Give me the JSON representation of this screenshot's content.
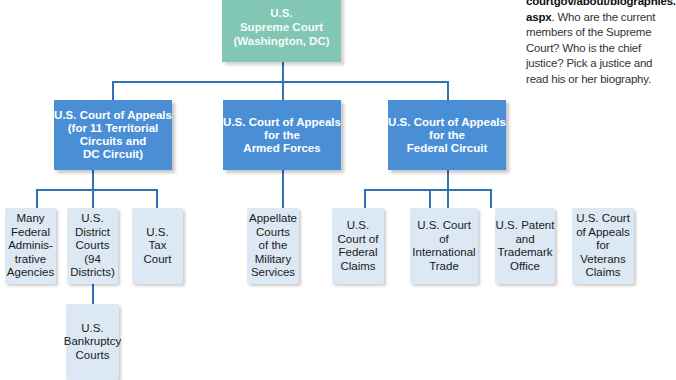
{
  "sidebar_note": {
    "link_line1": "courtgov/about/biographies.",
    "link_line2": "aspx",
    "text": ". Who are the current members of the Supreme Court? Who is the chief justice? Pick a justice and read his or her biography."
  },
  "root": {
    "label": "U.S.\nSupreme Court\n(Washington, DC)"
  },
  "appeals": [
    {
      "label": "U.S. Court of Appeals\n(for 11 Territorial\nCircuits and\nDC Circuit)"
    },
    {
      "label": "U.S. Court of Appeals\nfor the\nArmed Forces"
    },
    {
      "label": "U.S. Court of Appeals\nfor the\nFederal Circuit"
    }
  ],
  "lower": [
    {
      "label": "Many\nFederal\nAdminis-\ntrative\nAgencies"
    },
    {
      "label": "U.S.\nDistrict\nCourts\n(94\nDistricts)"
    },
    {
      "label": "U.S.\nTax\nCourt"
    },
    {
      "label": "Appellate\nCourts\nof the\nMilitary\nServices"
    },
    {
      "label": "U.S.\nCourt of\nFederal\nClaims"
    },
    {
      "label": "U.S. Court\nof\nInternational\nTrade"
    },
    {
      "label": "U.S. Patent\nand\nTrademark\nOffice"
    },
    {
      "label": "U.S. Court\nof Appeals\nfor\nVeterans\nClaims"
    }
  ],
  "bankruptcy": {
    "label": "U.S.\nBankruptcy\nCourts"
  },
  "colors": {
    "root": "#82c6b4",
    "appeals": "#4a8fd6",
    "lower": "#dce8f4",
    "connector": "#2f72b8"
  }
}
